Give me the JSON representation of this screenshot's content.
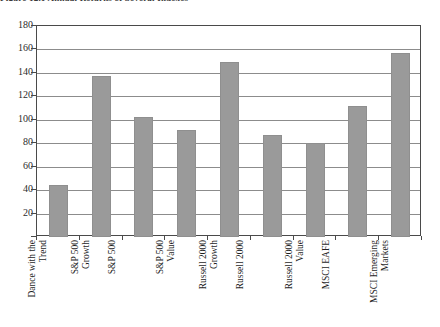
{
  "figure": {
    "title_clipped": "Figure 12.1   Annual Returns of Several Indexes"
  },
  "chart_data": {
    "type": "bar",
    "title": "",
    "xlabel": "",
    "ylabel": "",
    "ylim": [
      0,
      180
    ],
    "ytick_step": 20,
    "grid": true,
    "legend": "none",
    "bar_color": "#9a9a9a",
    "categories": [
      "Dance with the Trend",
      "S&P 500 Growth",
      "S&P 500",
      "S&P 500 Value",
      "Russell 2000 Growth",
      "Russell 2000",
      "Russell 2000 Value",
      "MSCI EAFE",
      "MSCI Emerging Markets"
    ],
    "category_lines": [
      [
        "Dance with the",
        "Trend"
      ],
      [
        "S&P 500",
        "Growth"
      ],
      [
        "S&P 500"
      ],
      [
        "S&P 500",
        "Value"
      ],
      [
        "Russell 2000",
        "Growth"
      ],
      [
        "Russell 2000"
      ],
      [
        "Russell 2000",
        "Value"
      ],
      [
        "MSCI EAFE"
      ],
      [
        "MSCI Emerging",
        "Markets"
      ]
    ],
    "values": [
      44,
      137,
      102,
      91,
      149,
      87,
      80,
      112,
      157
    ],
    "ytick_labels": [
      "180",
      "160",
      "140",
      "120",
      "100",
      "80",
      "60",
      "40",
      "20"
    ]
  }
}
